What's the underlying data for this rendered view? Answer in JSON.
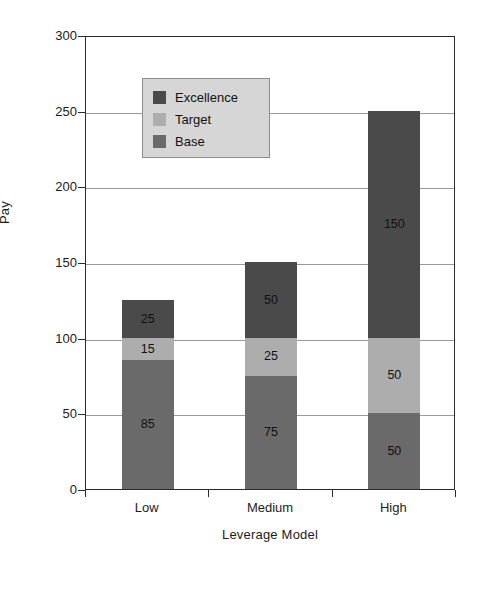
{
  "chart_data": {
    "type": "bar",
    "stacked": true,
    "title": "",
    "xlabel": "Leverage Model",
    "ylabel": "Pay",
    "categories": [
      "Low",
      "Medium",
      "High"
    ],
    "series": [
      {
        "name": "Base",
        "values": [
          85,
          75,
          50
        ],
        "color": "#6a6a6a"
      },
      {
        "name": "Target",
        "values": [
          15,
          25,
          50
        ],
        "color": "#adadad"
      },
      {
        "name": "Excellence",
        "values": [
          25,
          50,
          150
        ],
        "color": "#4a4a4a"
      }
    ],
    "totals": [
      125,
      150,
      250
    ],
    "ylim": [
      0,
      300
    ],
    "yticks": [
      0,
      50,
      100,
      150,
      200,
      250,
      300
    ],
    "ytick_labels": [
      "0",
      "50",
      "100",
      "150",
      "200",
      "250",
      "300"
    ],
    "grid": true,
    "legend_position": "upper-left-inside",
    "legend_entries": [
      "Excellence",
      "Target",
      "Base"
    ],
    "data_labels": {
      "Low": {
        "Base": "85",
        "Target": "15",
        "Excellence": "25"
      },
      "Medium": {
        "Base": "75",
        "Target": "25",
        "Excellence": "50"
      },
      "High": {
        "Base": "50",
        "Target": "50",
        "Excellence": "150"
      }
    }
  },
  "axes": {
    "y_title": "Pay",
    "x_title": "Leverage Model",
    "y_labels": [
      "300",
      "250",
      "200",
      "150",
      "100",
      "50",
      "0"
    ],
    "x_labels": [
      "Low",
      "Medium",
      "High"
    ]
  },
  "legend": {
    "items": [
      {
        "label": "Excellence",
        "color": "#4a4a4a"
      },
      {
        "label": "Target",
        "color": "#adadad"
      },
      {
        "label": "Base",
        "color": "#6a6a6a"
      }
    ],
    "background": "#d6d6d6",
    "border": "#8d8d8d"
  },
  "colors": {
    "base": "#6a6a6a",
    "target": "#adadad",
    "excellence": "#4a4a4a",
    "frame": "#2b2b2b",
    "grid": "#9a9a9a",
    "text": "#1c1c1c",
    "background": "#ffffff"
  }
}
